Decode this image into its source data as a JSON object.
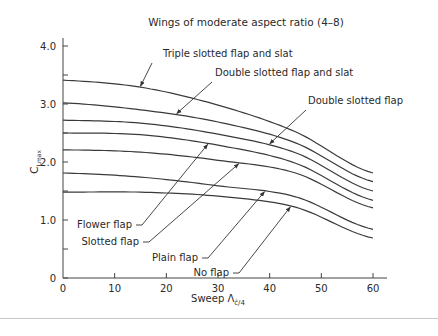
{
  "chart_data": {
    "type": "line",
    "title": "Wings of moderate aspect ratio (4–8)",
    "xlabel": "Sweep Λ",
    "xlabel_subscript": "c̄/4",
    "ylabel": "C",
    "ylabel_subscript": "Lmax",
    "xlim": [
      0,
      60
    ],
    "ylim": [
      0,
      4.0
    ],
    "x_ticks": [
      "0",
      "10",
      "20",
      "30",
      "40",
      "50",
      "60"
    ],
    "y_ticks": [
      "0",
      "1.0",
      "2.0",
      "3.0",
      "4.0"
    ],
    "grid": false,
    "x": [
      0,
      15,
      30,
      45,
      60
    ],
    "series": [
      {
        "name": "Triple slotted flap and slat",
        "values": [
          3.41,
          3.29,
          2.98,
          2.52,
          1.81
        ]
      },
      {
        "name": "Double slotted flap and slat",
        "values": [
          3.02,
          2.9,
          2.69,
          2.33,
          1.66
        ]
      },
      {
        "name": "Double slotted flap",
        "values": [
          2.72,
          2.67,
          2.48,
          2.16,
          1.5
        ]
      },
      {
        "name": "Flower flap",
        "values": [
          2.5,
          2.47,
          2.29,
          1.98,
          1.34
        ]
      },
      {
        "name": "Slotted flap",
        "values": [
          2.21,
          2.17,
          2.03,
          1.81,
          1.21
        ]
      },
      {
        "name": "Plain flap",
        "values": [
          1.81,
          1.74,
          1.59,
          1.4,
          0.84
        ]
      },
      {
        "name": "No flap",
        "values": [
          1.48,
          1.48,
          1.41,
          1.22,
          0.69
        ]
      }
    ],
    "annotations": [
      {
        "text": "Triple slotted flap and slat",
        "series": 0,
        "at_x": 15
      },
      {
        "text": "Double slotted flap and slat",
        "series": 1,
        "at_x": 22
      },
      {
        "text": "Double slotted flap",
        "series": 2,
        "at_x": 40
      },
      {
        "text": "Flower flap",
        "series": 3,
        "at_x": 28
      },
      {
        "text": "Slotted flap",
        "series": 4,
        "at_x": 34
      },
      {
        "text": "Plain flap",
        "series": 5,
        "at_x": 39
      },
      {
        "text": "No flap",
        "series": 6,
        "at_x": 44
      }
    ],
    "legend": "none (inline annotations with arrows)"
  }
}
